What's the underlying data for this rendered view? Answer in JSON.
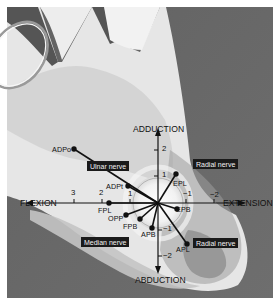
{
  "diagram": {
    "axes": {
      "vertical_positive_label": "ADDUCTION",
      "vertical_negative_label": "ABDUCTION",
      "horizontal_negative_label": "FLEXION",
      "horizontal_positive_label": "EXTENSION"
    },
    "ticks": {
      "flexion_3": "3",
      "flexion_2": "2",
      "flexion_1": "1",
      "extension_-1": "−1",
      "extension_-2": "−2",
      "adduction_1": "1",
      "adduction_2": "2",
      "abduction_-1": "−1",
      "abduction_-2": "−2"
    },
    "muscles": [
      {
        "id": "ADPo",
        "label": "ADPo"
      },
      {
        "id": "ADPt",
        "label": "ADPt"
      },
      {
        "id": "EPL",
        "label": "EPL"
      },
      {
        "id": "FPL",
        "label": "FPL"
      },
      {
        "id": "EPB",
        "label": "EPB"
      },
      {
        "id": "OPP",
        "label": "OPP"
      },
      {
        "id": "FPB",
        "label": "FPB"
      },
      {
        "id": "APB",
        "label": "APB"
      },
      {
        "id": "APL",
        "label": "APL"
      }
    ],
    "nerves": {
      "ulnar": "Ulnar nerve",
      "radial_top": "Radial nerve",
      "median": "Median nerve",
      "radial_bottom": "Radial nerve"
    },
    "colors": {
      "background_dark": "#6b6b6b",
      "hand_light": "#e2e2e2",
      "hand_mid": "#c9c9c9",
      "circle_fill": "#dcdcdc",
      "vector": "#111111",
      "nerve_label_bg": "#1a1a1a"
    }
  }
}
